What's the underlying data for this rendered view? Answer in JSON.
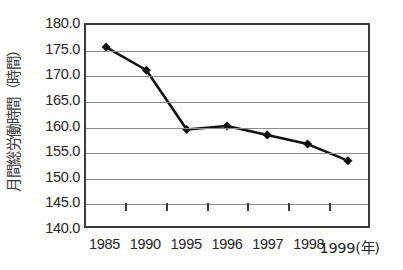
{
  "chart_data": {
    "type": "line",
    "title": "",
    "subtitle": "",
    "xlabel": "(年)",
    "ylabel": "月間総労働時間（時間）",
    "categories": [
      "1985",
      "1990",
      "1995",
      "1996",
      "1997",
      "1998",
      "1999"
    ],
    "x_tick_labels": [
      "1985",
      "1990",
      "1995",
      "1996",
      "1997",
      "1998",
      "1999(年)"
    ],
    "values": [
      175.6,
      171.0,
      159.2,
      159.9,
      158.1,
      156.3,
      153.0
    ],
    "series": [
      {
        "name": "月間総労働時間",
        "values": [
          175.6,
          171.0,
          159.2,
          159.9,
          158.1,
          156.3,
          153.0
        ]
      }
    ],
    "ylim": [
      140.0,
      180.0
    ],
    "ytick_step": 5.0,
    "y_tick_labels": [
      "180.0",
      "175.0",
      "170.0",
      "165.0",
      "160.0",
      "155.0",
      "150.0",
      "145.0",
      "140.0"
    ],
    "y_tick_values": [
      180.0,
      175.0,
      170.0,
      165.0,
      160.0,
      155.0,
      150.0,
      145.0,
      140.0
    ],
    "grid": true,
    "grid_axis": "y",
    "legend": false,
    "legend_position": "none",
    "marker": "diamond",
    "annotations": []
  },
  "style": {
    "background_color": "#fdfdfc",
    "frame_color": "#3d3d3d",
    "gridline_color": "#8b8b8b",
    "series_color": "#111111",
    "marker_color": "#111111",
    "text_color": "#262626"
  }
}
